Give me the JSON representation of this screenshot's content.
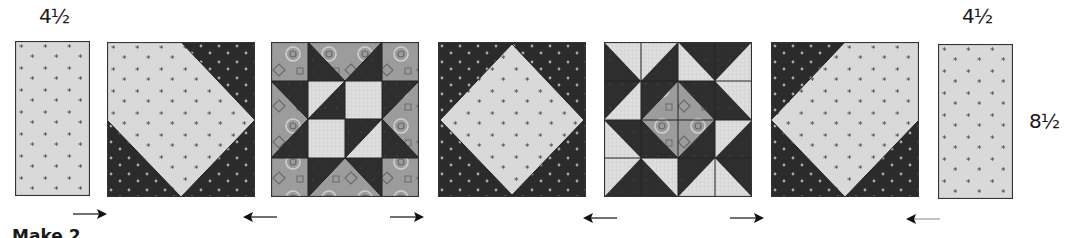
{
  "diagram": {
    "labels": {
      "top_left_dimension": "4½",
      "top_right_dimension": "4½",
      "right_height_dimension": "8½",
      "caption": "Make 2"
    },
    "colors": {
      "light_fabric": "#d9d9d9",
      "dark_fabric": "#2b2b2b",
      "medium_print": "#9c9c9c",
      "grid_light": "#e2e2e2",
      "outline": "#333333",
      "arrow": "#111111"
    },
    "row": [
      {
        "type": "rectangle",
        "name": "left-side-rectangle",
        "fabric": "light star print",
        "width_label": "4½"
      },
      {
        "type": "block",
        "name": "snowball-block-left",
        "pattern": "light square with dark corner triangles (top-right, bottom-left)"
      },
      {
        "type": "block",
        "name": "sawtooth-star-block",
        "pattern": "star with dark points, light center, medium print background"
      },
      {
        "type": "block",
        "name": "square-in-square-block",
        "pattern": "light diamond on dark background"
      },
      {
        "type": "block",
        "name": "pinwheel-star-block",
        "pattern": "dark pinwheel triangles around medium-print center diamond"
      },
      {
        "type": "block",
        "name": "snowball-block-right",
        "pattern": "light square with dark corner triangles (top-left, bottom-right)"
      },
      {
        "type": "rectangle",
        "name": "right-side-rectangle",
        "fabric": "light star print",
        "width_label": "4½",
        "height_label": "8½"
      }
    ],
    "pressing_arrows": [
      "right",
      "left",
      "right",
      "left",
      "right",
      "left"
    ]
  }
}
